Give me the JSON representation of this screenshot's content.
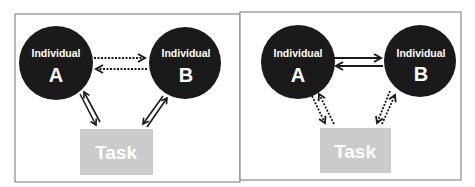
{
  "diagram": {
    "type": "interaction-model-comparison",
    "colors": {
      "background": "#ffffff",
      "frame_border": "#8a8a8a",
      "individual_fill": "#1a1a1a",
      "individual_text": "#ffffff",
      "task_fill": "#cbcbcb",
      "task_text": "#ffffff",
      "arrow": "#1a1a1a"
    },
    "panels": [
      {
        "id": "left",
        "individual_a": {
          "caption": "Individual",
          "letter": "A"
        },
        "individual_b": {
          "caption": "Individual",
          "letter": "B"
        },
        "task": {
          "label": "Task"
        },
        "edges": [
          {
            "from": "A",
            "to": "B",
            "style": "dotted",
            "direction": "bidirectional"
          },
          {
            "from": "A",
            "to": "Task",
            "style": "solid-hollow",
            "direction": "bidirectional"
          },
          {
            "from": "B",
            "to": "Task",
            "style": "solid-hollow",
            "direction": "bidirectional"
          }
        ]
      },
      {
        "id": "right",
        "individual_a": {
          "caption": "Individual",
          "letter": "A"
        },
        "individual_b": {
          "caption": "Individual",
          "letter": "B"
        },
        "task": {
          "label": "Task"
        },
        "edges": [
          {
            "from": "A",
            "to": "B",
            "style": "solid",
            "direction": "bidirectional"
          },
          {
            "from": "A",
            "to": "Task",
            "style": "dotted",
            "direction": "bidirectional"
          },
          {
            "from": "B",
            "to": "Task",
            "style": "dotted",
            "direction": "bidirectional"
          }
        ]
      }
    ]
  }
}
